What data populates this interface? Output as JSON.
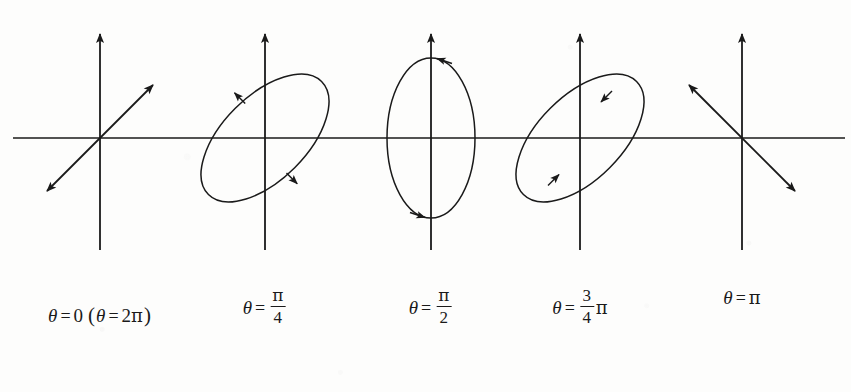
{
  "figure": {
    "background_color": "#fdfdfc",
    "ink_color": "#1a1a1a",
    "axis_y_horizontal": 138,
    "axis_extent_left": 13,
    "axis_extent_right": 845
  },
  "panels": [
    {
      "id": "panel-theta-0",
      "center_x": 100,
      "center_y": 138,
      "shape": "line",
      "shape_description": "double-headed straight arrow at +45 degrees",
      "tilt_deg": -45,
      "arrow_heads": [
        "up-right",
        "down-left"
      ],
      "label": {
        "line1": {
          "theta": "θ",
          "eq": "=",
          "value": "0"
        },
        "line2": {
          "open": "(",
          "theta": "θ",
          "eq": "=",
          "coef": "2",
          "pi": "π",
          "close": ")"
        }
      }
    },
    {
      "id": "panel-theta-pi-over-4",
      "center_x": 265,
      "center_y": 138,
      "shape": "ellipse",
      "shape_description": "ellipse tilted +45 degrees, counterclockwise sense",
      "tilt_deg": -45,
      "semi_major": 80,
      "semi_minor": 42,
      "rotation_sense": "counterclockwise",
      "arrow_heads": [
        "upper-left",
        "lower-right"
      ],
      "label": {
        "line1": {
          "theta": "θ",
          "eq": "=",
          "numerator": "π",
          "denominator": "4"
        }
      }
    },
    {
      "id": "panel-theta-pi-over-2",
      "center_x": 431,
      "center_y": 138,
      "shape": "ellipse",
      "shape_description": "upright ellipse, vertical major axis, counterclockwise sense",
      "tilt_deg": 0,
      "semi_major": 80,
      "semi_minor": 44,
      "rotation_sense": "counterclockwise",
      "arrow_heads": [
        "top",
        "bottom"
      ],
      "label": {
        "line1": {
          "theta": "θ",
          "eq": "=",
          "numerator": "π",
          "denominator": "2"
        }
      }
    },
    {
      "id": "panel-theta-3pi-over-4",
      "center_x": 580,
      "center_y": 138,
      "shape": "ellipse",
      "shape_description": "ellipse tilted +45 degrees, clockwise sense",
      "tilt_deg": -45,
      "semi_major": 80,
      "semi_minor": 42,
      "rotation_sense": "clockwise",
      "arrow_heads": [
        "upper-right",
        "lower-left"
      ],
      "label": {
        "line1": {
          "theta": "θ",
          "eq": "=",
          "numerator": "3",
          "denominator": "4",
          "pi": "π"
        }
      }
    },
    {
      "id": "panel-theta-pi",
      "center_x": 742,
      "center_y": 138,
      "shape": "line",
      "shape_description": "double-headed straight arrow at -45 degrees",
      "tilt_deg": 45,
      "arrow_heads": [
        "up-left",
        "down-right"
      ],
      "label": {
        "line1": {
          "theta": "θ",
          "eq": "=",
          "pi": "π"
        }
      }
    }
  ],
  "label_row": {
    "line1_y": 296,
    "line2_y": 296
  }
}
